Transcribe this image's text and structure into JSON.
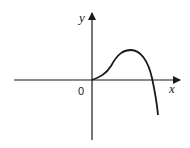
{
  "diagram": {
    "type": "function-graph-sketch",
    "axes": {
      "x_label": "x",
      "y_label": "y",
      "origin_label": "0"
    },
    "curve": {
      "description": "Curve starts at origin, rises to a single local maximum in the first quadrant, then falls steeply crossing the positive x-axis and continuing downward",
      "stroke_color": "#1a1a1a"
    },
    "colors": {
      "background": "#ffffff",
      "ink": "#1a1a1a"
    }
  }
}
